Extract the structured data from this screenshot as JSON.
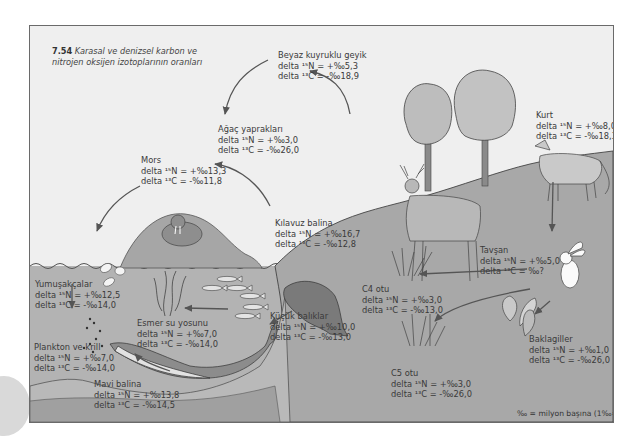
{
  "figure": {
    "number": "7.54",
    "title": "Karasal ve denizsel karbon ve nitrojen oksijen izotoplarının oranları",
    "title_line1": "Karasal ve denizsel karbon ve",
    "title_line2": "nitrojen oksijen izotoplarının oranları",
    "footnote": "‰ = milyon başına (1‰=¹⁄₁₀₀₀)",
    "colors": {
      "sky": "#efefef",
      "land": "#a9a9a9",
      "water": "#b4b4b4",
      "seabed": "#9a9a9a",
      "frame": "#6a6a6a",
      "text": "#3a3a3a"
    }
  },
  "organisms": [
    {
      "id": "beyaz-kuyruklu-geyik",
      "name": "Beyaz kuyruklu geyik",
      "delta_n_label": "delta ¹⁵N = +‰5,3",
      "delta_c_label": "delta ¹³C = -‰18,9",
      "delta15N": "+5.3",
      "delta13C": "-18.9"
    },
    {
      "id": "agac-yapraklari",
      "name": "Ağaç yaprakları",
      "delta_n_label": "delta ¹⁵N = +‰3,0",
      "delta_c_label": "delta ¹³C = -‰26,0",
      "delta15N": "+3.0",
      "delta13C": "-26.0"
    },
    {
      "id": "kurt",
      "name": "Kurt",
      "delta_n_label": "delta ¹⁵N = +‰8,0",
      "delta_c_label": "delta ¹³C = -‰18,3",
      "delta15N": "+8.0",
      "delta13C": "-18.3"
    },
    {
      "id": "mors",
      "name": "Mors",
      "delta_n_label": "delta ¹⁵N = +‰13,3",
      "delta_c_label": "delta ¹³C = -‰11,8",
      "delta15N": "+13.3",
      "delta13C": "-11.8"
    },
    {
      "id": "kilavuz-balina",
      "name": "Kılavuz balina",
      "delta_n_label": "delta ¹⁵N = +‰16,7",
      "delta_c_label": "delta ¹³C = -‰12,8",
      "delta15N": "+16.7",
      "delta13C": "-12.8"
    },
    {
      "id": "tavsan",
      "name": "Tavşan",
      "delta_n_label": "delta ¹⁵N = +‰5,0",
      "delta_c_label": "delta ¹³C = ‰?",
      "delta15N": "+5.0",
      "delta13C": "?"
    },
    {
      "id": "yumusakcalar",
      "name": "Yumuşakçalar",
      "delta_n_label": "delta ¹⁵N = +‰12,5",
      "delta_c_label": "delta ¹³C = -‰14,0",
      "delta15N": "+12.5",
      "delta13C": "-14.0"
    },
    {
      "id": "esmer-su-yosunu",
      "name": "Esmer su yosunu",
      "delta_n_label": "delta ¹⁵N = +‰7,0",
      "delta_c_label": "delta ¹³C = -‰14,0",
      "delta15N": "+7.0",
      "delta13C": "-14.0"
    },
    {
      "id": "kucuk-baliklar",
      "name": "Küçük balıklar",
      "delta_n_label": "delta ¹⁵N = +‰10,0",
      "delta_c_label": "delta ¹³C = -‰13,0",
      "delta15N": "+10.0",
      "delta13C": "-13.0"
    },
    {
      "id": "c4-otu",
      "name": "C4 otu",
      "delta_n_label": "delta ¹⁵N = +‰3,0",
      "delta_c_label": "delta ¹³C = -‰13,0",
      "delta15N": "+3.0",
      "delta13C": "-13.0"
    },
    {
      "id": "plankton-ve-krill",
      "name": "Plankton ve krill",
      "delta_n_label": "delta ¹⁵N = +‰7,0",
      "delta_c_label": "delta ¹³C = -‰14,0",
      "delta15N": "+7.0",
      "delta13C": "-14.0"
    },
    {
      "id": "baklagiller",
      "name": "Baklagiller",
      "delta_n_label": "delta ¹⁵N = +‰1,0",
      "delta_c_label": "delta ¹³C = -‰26,0",
      "delta15N": "+1.0",
      "delta13C": "-26.0"
    },
    {
      "id": "mavi-balina",
      "name": "Mavi balina",
      "delta_n_label": "delta ¹⁵N = +‰13,8",
      "delta_c_label": "delta ¹³C = -‰14,5",
      "delta15N": "+13.8",
      "delta13C": "-14.5"
    },
    {
      "id": "c5-otu",
      "name": "C5 otu",
      "delta_n_label": "delta ¹⁵N = +‰3,0",
      "delta_c_label": "delta ¹³C = -‰26,0",
      "delta15N": "+3.0",
      "delta13C": "-26.0"
    }
  ],
  "food_web_arrows": [
    {
      "from": "Beyaz kuyruklu geyik",
      "to": "Ağaç yaprakları"
    },
    {
      "from": "Kurt",
      "to": "Beyaz kuyruklu geyik"
    },
    {
      "from": "Kurt",
      "to": "Tavşan"
    },
    {
      "from": "Tavşan",
      "to": "C4 otu"
    },
    {
      "from": "Tavşan",
      "to": "C5 otu"
    },
    {
      "from": "Tavşan",
      "to": "Baklagiller"
    },
    {
      "from": "Kılavuz balina",
      "to": "Mors"
    },
    {
      "from": "Mors",
      "to": "Yumuşakçalar"
    },
    {
      "from": "Yumuşakçalar",
      "to": "Plankton ve krill"
    },
    {
      "from": "Kılavuz balina",
      "to": "Küçük balıklar"
    },
    {
      "from": "Küçük balıklar",
      "to": "Esmer su yosunu"
    },
    {
      "from": "Mavi balina",
      "to": "Plankton ve krill"
    }
  ]
}
